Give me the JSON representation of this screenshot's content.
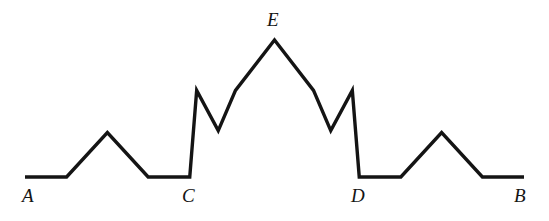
{
  "figure": {
    "name": "koch-curve-iteration-2",
    "type": "line-diagram",
    "background_color": "#ffffff",
    "stroke_color": "#141414",
    "stroke_width": 3.4,
    "canvas": {
      "width": 549,
      "height": 221
    }
  },
  "curve": {
    "description": "Koch curve, second iteration, drawn as a single open polyline from A to B with apex E at the top and intermediate baseline vertices C and D.",
    "segment_count": 16,
    "baseline_y": 177,
    "points": [
      [
        25,
        177
      ],
      [
        66.58,
        177
      ],
      [
        107.37,
        132.6
      ],
      [
        148.17,
        177
      ],
      [
        189.75,
        177
      ],
      [
        196.68,
        90.35
      ],
      [
        235.49,
        90.35
      ],
      [
        274.5,
        40.03
      ],
      [
        313.51,
        90.35
      ],
      [
        352.32,
        90.35
      ],
      [
        359.25,
        177
      ],
      [
        400.83,
        177
      ],
      [
        441.63,
        132.6
      ],
      [
        482.42,
        177
      ],
      [
        524,
        177
      ]
    ],
    "inner_notch_points": [
      [
        218.24,
        130.61
      ],
      [
        330.76,
        130.61
      ]
    ]
  },
  "labels": [
    {
      "id": "label-A",
      "text": "A",
      "x": 22,
      "y": 186,
      "anchor_point": [
        25,
        177
      ]
    },
    {
      "id": "label-C",
      "text": "C",
      "x": 182,
      "y": 186,
      "anchor_point": [
        189.75,
        177
      ]
    },
    {
      "id": "label-E",
      "text": "E",
      "x": 267,
      "y": 10,
      "anchor_point": [
        274.5,
        40.03
      ]
    },
    {
      "id": "label-D",
      "text": "D",
      "x": 351,
      "y": 186,
      "anchor_point": [
        359.25,
        177
      ]
    },
    {
      "id": "label-B",
      "text": "B",
      "x": 514,
      "y": 186,
      "anchor_point": [
        524,
        177
      ]
    }
  ],
  "chart_data": {
    "type": "line",
    "title": "",
    "xlabel": "",
    "ylabel": "",
    "grid": false,
    "legend": "none",
    "series": [
      {
        "name": "koch-curve",
        "x": [
          25,
          66.58,
          107.37,
          148.17,
          189.75,
          196.68,
          218.24,
          235.49,
          274.5,
          313.51,
          330.76,
          352.32,
          359.25,
          400.83,
          441.63,
          482.42,
          524
        ],
        "y": [
          177,
          177,
          132.6,
          177,
          177,
          90.35,
          130.61,
          90.35,
          40.03,
          90.35,
          130.61,
          90.35,
          177,
          177,
          132.6,
          177,
          177
        ]
      }
    ],
    "annotations": [
      "A",
      "C",
      "E",
      "D",
      "B"
    ]
  }
}
